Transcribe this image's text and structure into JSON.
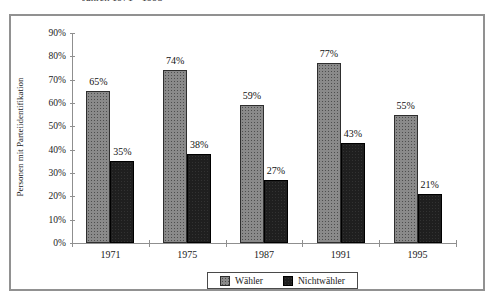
{
  "page": {
    "background_color": "#ffffff",
    "frame_border_color": "#919191"
  },
  "header": {
    "clipped_title_fragment": "Jahren 1971 - 1995"
  },
  "chart_data": {
    "type": "bar",
    "categories": [
      "1971",
      "1975",
      "1987",
      "1991",
      "1995"
    ],
    "series": [
      {
        "name": "Wähler",
        "values": [
          65,
          74,
          59,
          77,
          55
        ],
        "fill": "#8a8a8a",
        "pattern": "dotted-gray"
      },
      {
        "name": "Nichtwähler",
        "values": [
          35,
          38,
          27,
          43,
          21
        ],
        "fill": "#1f1f1f",
        "pattern": "solid-black"
      }
    ],
    "data_labels": {
      "Wähler": [
        "65%",
        "74%",
        "59%",
        "77%",
        "55%"
      ],
      "Nichtwähler": [
        "35%",
        "38%",
        "27%",
        "43%",
        "21%"
      ]
    },
    "title": "",
    "xlabel": "",
    "ylabel": "Personen mit Parteiidentifikation",
    "ylim": [
      0,
      90
    ],
    "ytick_step": 10,
    "ytick_labels": [
      "0%",
      "10%",
      "20%",
      "30%",
      "40%",
      "50%",
      "60%",
      "70%",
      "80%",
      "90%"
    ],
    "grid": false,
    "legend_position": "bottom-center",
    "axis_color": "#8f8f8f"
  }
}
